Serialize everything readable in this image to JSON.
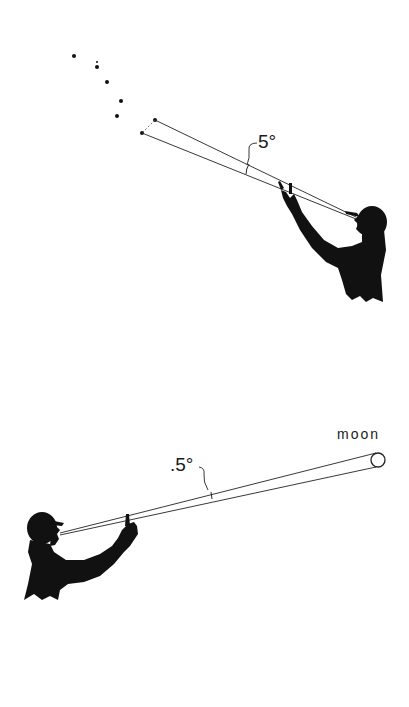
{
  "figure": {
    "top_panel": {
      "subject": "person sighting stars with outstretched hand",
      "angle_label": "5°",
      "stars": [
        {
          "x": 74,
          "y": 56,
          "r": 2
        },
        {
          "x": 97,
          "y": 62,
          "r": 1
        },
        {
          "x": 97,
          "y": 67,
          "r": 2
        },
        {
          "x": 107,
          "y": 82,
          "r": 2
        },
        {
          "x": 121,
          "y": 101,
          "r": 2
        },
        {
          "x": 117,
          "y": 116,
          "r": 2
        },
        {
          "x": 155,
          "y": 120,
          "r": 2
        },
        {
          "x": 142,
          "y": 133,
          "r": 2
        }
      ]
    },
    "bottom_panel": {
      "subject": "person sighting the moon with outstretched hand",
      "angle_label": ".5°",
      "target_label": "moon"
    },
    "colors": {
      "ink": "#111111",
      "background": "#ffffff"
    }
  }
}
